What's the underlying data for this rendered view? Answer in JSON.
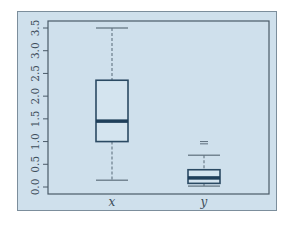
{
  "chart_data": {
    "type": "boxplot",
    "title": "",
    "xlabel": "",
    "ylabel": "",
    "categories": [
      "x",
      "y"
    ],
    "ylim": [
      0.0,
      3.5
    ],
    "yticks": [
      "0.0",
      "0.5",
      "1.0",
      "1.5",
      "2.0",
      "2.5",
      "3.0",
      "3.5"
    ],
    "grid": false,
    "boxes": [
      {
        "name": "x",
        "whisker_low": 0.15,
        "q1": 1.0,
        "median": 1.45,
        "q3": 2.35,
        "whisker_high": 3.5,
        "outliers": []
      },
      {
        "name": "y",
        "whisker_low": 0.02,
        "q1": 0.08,
        "median": 0.2,
        "q3": 0.38,
        "whisker_high": 0.7,
        "outliers": [
          0.95,
          1.0
        ]
      }
    ],
    "colors": {
      "background": "#cfe0ec",
      "box": "#2b4a63",
      "median": "#1f3f5a",
      "axis": "#4a5a68"
    }
  }
}
